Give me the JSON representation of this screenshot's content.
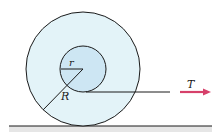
{
  "diagram": {
    "labels": {
      "inner_radius": "r",
      "outer_radius": "R",
      "tension": "T"
    },
    "colors": {
      "outer_disk": "#e3f3f8",
      "inner_disk": "#cde6f3",
      "stroke": "#1a1a1a",
      "arrow": "#d6406a",
      "ground_band": "#e6e6e6"
    }
  }
}
